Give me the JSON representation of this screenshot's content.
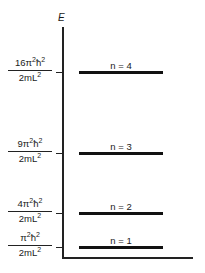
{
  "diagram": {
    "type": "energy-level-diagram",
    "axis_label": "E",
    "levels": [
      {
        "n_label": "n = 4",
        "n": 4,
        "num_coef": "16π",
        "den": "2mL",
        "energy": "16π²ħ²/2mL²"
      },
      {
        "n_label": "n = 3",
        "n": 3,
        "num_coef": "9π",
        "den": "2mL",
        "energy": "9π²ħ²/2mL²"
      },
      {
        "n_label": "n = 2",
        "n": 2,
        "num_coef": "4π",
        "den": "2mL",
        "energy": "4π²ħ²/2mL²"
      },
      {
        "n_label": "n = 1",
        "n": 1,
        "num_coef": "π",
        "den": "2mL",
        "energy": "π²ħ²/2mL²"
      }
    ],
    "sup": "2",
    "hbar": "ħ"
  }
}
